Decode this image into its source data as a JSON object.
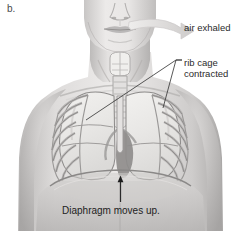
{
  "figure": {
    "panel_letter": "b.",
    "caption_bottom": "Diaphragm moves up.",
    "labels": {
      "air_exhaled": "air exhaled",
      "rib_cage_line1": "rib cage",
      "rib_cage_line2": "contracted"
    },
    "colors": {
      "background": "#ffffff",
      "text": "#2b2b2b",
      "panel_letter": "#4a4a4a",
      "skin_light": "#e9e7e6",
      "skin_mid": "#c9c7c6",
      "skin_dark": "#9d9b9a",
      "lung": "#ededeb",
      "lung_outline": "#8e8c8b",
      "rib": "#b8b6b5",
      "rib_outline": "#8a8887",
      "trachea": "#dcdad9",
      "heart_shadow": "#8d8b8a",
      "arrow_exhale": "#d8d6d5",
      "arrow_diaphragm": "#2a2a2a",
      "leader_line": "#3a3a3a"
    },
    "icons": {
      "exhale_arrow": "curved-arrow-right-icon",
      "diaphragm_arrow": "arrow-up-icon"
    }
  }
}
